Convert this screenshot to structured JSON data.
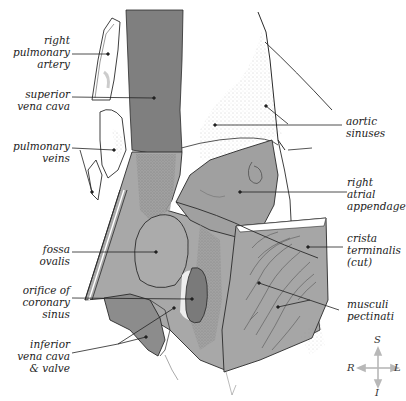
{
  "diagram": {
    "colors": {
      "dark_vessel": "#7f7f7f",
      "tissue_mid": "#a6a6a6",
      "tissue_dark": "#8c8c8c",
      "outline": "#2a2a2a",
      "stipple": "#9a9a9a",
      "leader": "#222222",
      "compass": "#b8b8b8"
    },
    "labels_left": [
      {
        "id": "right-pulmonary-artery",
        "text": "right\npulmonary\nartery"
      },
      {
        "id": "superior-vena-cava",
        "text": "superior\nvena cava"
      },
      {
        "id": "pulmonary-veins",
        "text": "pulmonary\nveins"
      },
      {
        "id": "fossa-ovalis",
        "text": "fossa\novalis"
      },
      {
        "id": "orifice-of-coronary-sinus",
        "text": "orifice of\ncoronary\nsinus"
      },
      {
        "id": "inferior-vena-cava-valve",
        "text": "inferior\nvena cava\n& valve"
      }
    ],
    "labels_right": [
      {
        "id": "aortic-sinuses",
        "text": "aortic\nsinuses"
      },
      {
        "id": "right-atrial-appendage",
        "text": "right\natrial\nappendage"
      },
      {
        "id": "crista-terminalis",
        "text": "crista\nterminalis\n(cut)"
      },
      {
        "id": "musculi-pectinati",
        "text": "musculi\npectinati"
      }
    ],
    "compass": {
      "superior": "S",
      "inferior": "I",
      "right": "R",
      "left": "L"
    }
  }
}
